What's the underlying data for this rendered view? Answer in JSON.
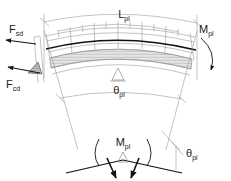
{
  "figure": {
    "background_color": "#ffffff",
    "width": 231,
    "height": 181
  },
  "labels": {
    "span_length": {
      "base": "L",
      "sub": "pl",
      "text": "Lpl"
    },
    "plastic_moment_top": {
      "base": "M",
      "sub": "pl",
      "text": "Mpl"
    },
    "force_sd": {
      "base": "F",
      "sub": "sd",
      "text": "Fsd"
    },
    "force_cd": {
      "base": "F",
      "sub": "cd",
      "text": "Fcd"
    },
    "rotation_angle_main": {
      "base": "θ",
      "sub": "pl",
      "text": "θpl"
    },
    "plastic_moment_detail": {
      "base": "M",
      "sub": "pl",
      "text": "Mpl"
    },
    "rotation_angle_detail": {
      "base": "θ",
      "sub": "pl",
      "text": "θpl"
    }
  },
  "elements": {
    "upper_dimension_arc": "Lpl span dimension arc across top of arch",
    "lower_dimension_arc": "theta-pl angular dimension arc below arch",
    "segmented_blocks": "six radial masonry/precast voussoir segments",
    "hatched_band": "shaded compression band along underside of arch",
    "pin_support_main": "triangular pin support under arch crown",
    "pin_support_detail": "triangular pin support in bottom hinge detail",
    "moment_arrow_right": "curved moment arrow Mpl at right abutment",
    "moment_arc_detail": "curved double-headed moment arc Mpl in hinge detail",
    "force_arrow_sd": "horizontal tension force arrow Fsd at left",
    "force_arrow_cd": "horizontal compression force arrow Fcd at left",
    "stress_wedge": "triangular hatched compression stress block at Fcd",
    "hinge_arrows": "two heavy inclined arrows at plastic hinge detail",
    "angle_ticks": "cross tick marks at dimension line extremities"
  },
  "colors": {
    "line_light": "#9a9a9a",
    "line_medium": "#6e6e6e",
    "line_heavy": "#111111",
    "hatch": "#8f8f8f",
    "text": "#1a1a1a",
    "background": "#ffffff"
  }
}
